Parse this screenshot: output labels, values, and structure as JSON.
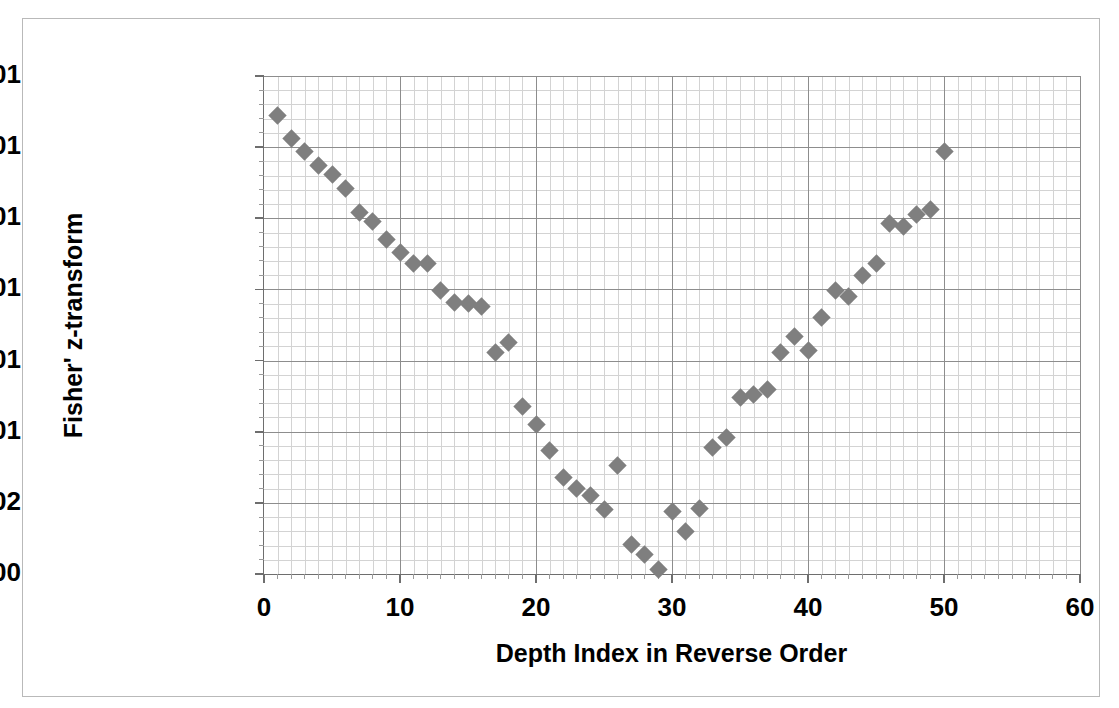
{
  "chart_data": {
    "type": "scatter",
    "title": "",
    "xlabel": "Depth Index in Reverse Order",
    "ylabel": "Fisher' z-transform",
    "xlim": [
      0,
      60
    ],
    "ylim": [
      0,
      0.35
    ],
    "x_tick_labels": [
      "0",
      "10",
      "20",
      "30",
      "40",
      "50",
      "60"
    ],
    "x_tick_values": [
      0,
      10,
      20,
      30,
      40,
      50,
      60
    ],
    "y_tick_labels": [
      "0.00E+00",
      "5.00E-02",
      "1.00E-01",
      "1.50E-01",
      "2.00E-01",
      "2.50E-01",
      "3.00E-01",
      "3.50E-01"
    ],
    "y_tick_values": [
      0,
      0.05,
      0.1,
      0.15,
      0.2,
      0.25,
      0.3,
      0.35
    ],
    "x_minor_step": 1,
    "y_minor_step": 0.01,
    "grid": true,
    "legend": false,
    "marker": "diamond",
    "marker_color": "#7f7f7f",
    "series_name": "Fisher z-transform vs depth index",
    "x": [
      1,
      2,
      3,
      4,
      5,
      6,
      7,
      8,
      9,
      10,
      11,
      12,
      13,
      14,
      15,
      16,
      17,
      18,
      19,
      20,
      21,
      22,
      23,
      24,
      25,
      26,
      27,
      28,
      29,
      30,
      31,
      32,
      33,
      34,
      35,
      36,
      37,
      38,
      39,
      40,
      41,
      42,
      43,
      44,
      45,
      46,
      47,
      48,
      49,
      50
    ],
    "y": [
      0.322,
      0.306,
      0.297,
      0.287,
      0.281,
      0.271,
      0.254,
      0.248,
      0.235,
      0.226,
      0.218,
      0.218,
      0.199,
      0.191,
      0.19,
      0.188,
      0.156,
      0.163,
      0.118,
      0.105,
      0.087,
      0.068,
      0.06,
      0.055,
      0.045,
      0.076,
      0.021,
      0.014,
      0.003,
      0.044,
      0.03,
      0.046,
      0.089,
      0.096,
      0.124,
      0.126,
      0.13,
      0.156,
      0.167,
      0.157,
      0.18,
      0.199,
      0.195,
      0.21,
      0.218,
      0.246,
      0.244,
      0.253,
      0.256,
      0.297
    ]
  },
  "axes": {
    "y_title": "Fisher' z-transform",
    "x_title": "Depth Index in Reverse Order"
  }
}
